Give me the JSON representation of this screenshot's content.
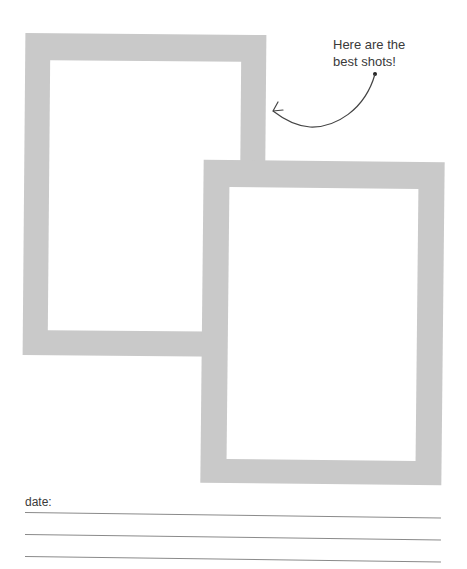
{
  "note": {
    "line1": "Here are the",
    "line2": "best shots!"
  },
  "photo_frames": [
    {
      "label": "photo-frame-1",
      "color": "#c9c9c9"
    },
    {
      "label": "photo-frame-2",
      "color": "#c9c9c9"
    }
  ],
  "footer": {
    "date_label": "date:",
    "writing_lines": 3
  }
}
